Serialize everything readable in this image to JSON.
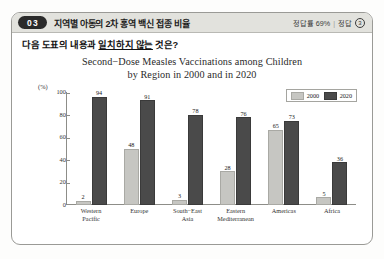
{
  "header": {
    "question_number": "03",
    "title": "지역별 아동의 2차 홍역 백신 접종 비율",
    "accuracy_label": "정답률 69%",
    "separator": "|",
    "answer_label": "정답",
    "answer_value": "3"
  },
  "question": {
    "prefix": "다음 도표의 내용과 ",
    "emphasis": "일치하지 않는",
    "suffix": " 것은?"
  },
  "chart_data": {
    "type": "bar",
    "title_line1": "Second−Dose Measles Vaccinations among Children",
    "title_line2": "by Region in 2000 and in 2020",
    "unit_label": "(%)",
    "xlabel": "",
    "ylabel": "",
    "ylim": [
      0,
      100
    ],
    "yticks": [
      100,
      80,
      60,
      40,
      20
    ],
    "y_zero_label": "0",
    "grid": false,
    "legend_position": "top-right",
    "categories": [
      "Western Pacific",
      "Europe",
      "South-East Asia",
      "Eastern Mediterranean",
      "Americas",
      "Africa"
    ],
    "categories_lines": [
      [
        "Western",
        "Pacific"
      ],
      [
        "Europe",
        ""
      ],
      [
        "South−East",
        "Asia"
      ],
      [
        "Eastern",
        "Mediterranean"
      ],
      [
        "Americas",
        ""
      ],
      [
        "Africa",
        ""
      ]
    ],
    "series": [
      {
        "name": "2000",
        "color": "#c6c6c2",
        "values": [
          2,
          48,
          3,
          28,
          65,
          5
        ]
      },
      {
        "name": "2020",
        "color": "#4a4a4a",
        "values": [
          94,
          91,
          78,
          76,
          73,
          36
        ]
      }
    ]
  }
}
